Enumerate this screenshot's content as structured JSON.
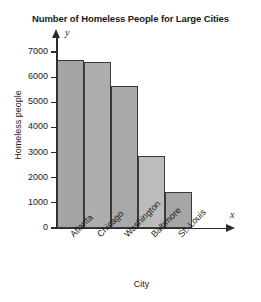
{
  "chart_data": {
    "type": "bar",
    "title": "Number of Homeless People for Large Cities",
    "xlabel": "City",
    "ylabel": "Homeless people",
    "x_axis_variable": "x",
    "y_axis_variable": "y",
    "categories": [
      "Atlanta",
      "Chicago",
      "Washington",
      "Baltimore",
      "St. Louis"
    ],
    "values": [
      6700,
      6600,
      5650,
      2850,
      1450
    ],
    "bar_colors": [
      "#a4a4a4",
      "#aeaeae",
      "#a9a9a9",
      "#bcbcbc",
      "#a6a6a6"
    ],
    "bar_border_color": "#3a3a3a",
    "ylim": [
      0,
      7400
    ],
    "yticks": [
      0,
      1000,
      2000,
      3000,
      4000,
      5000,
      6000,
      7000
    ],
    "ytick_labels": [
      "0",
      "1000",
      "2000",
      "3000",
      "4000",
      "5000",
      "6000",
      "7000"
    ],
    "grid": false,
    "legend": null,
    "axis_color": "#2b2b2b",
    "background_color": "#ffffff"
  }
}
